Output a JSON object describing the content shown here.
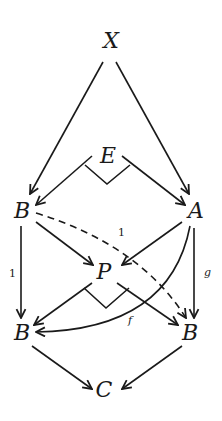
{
  "diagram": {
    "type": "commutative-diagram",
    "nodes": [
      {
        "id": "X",
        "label": "X"
      },
      {
        "id": "E",
        "label": "E"
      },
      {
        "id": "B1",
        "label": "B"
      },
      {
        "id": "A",
        "label": "A"
      },
      {
        "id": "P",
        "label": "P"
      },
      {
        "id": "B2",
        "label": "B"
      },
      {
        "id": "B3",
        "label": "B"
      },
      {
        "id": "C",
        "label": "C"
      }
    ],
    "edges": [
      {
        "from": "X",
        "to": "B1",
        "label": ""
      },
      {
        "from": "X",
        "to": "A",
        "label": ""
      },
      {
        "from": "E",
        "to": "B1",
        "label": ""
      },
      {
        "from": "E",
        "to": "A",
        "label": ""
      },
      {
        "from": "B1",
        "to": "P",
        "label": ""
      },
      {
        "from": "A",
        "to": "P",
        "label": ""
      },
      {
        "from": "B1",
        "to": "B2",
        "label": "1"
      },
      {
        "from": "B1",
        "to": "B3",
        "label": "1",
        "style": "dashed"
      },
      {
        "from": "A",
        "to": "B3",
        "label": "g"
      },
      {
        "from": "A",
        "to": "B2",
        "label": "f",
        "style": "curved"
      },
      {
        "from": "P",
        "to": "B2",
        "label": ""
      },
      {
        "from": "P",
        "to": "B3",
        "label": ""
      },
      {
        "from": "B2",
        "to": "C",
        "label": ""
      },
      {
        "from": "B3",
        "to": "C",
        "label": ""
      }
    ],
    "pullback_markers": [
      "E",
      "P"
    ]
  }
}
